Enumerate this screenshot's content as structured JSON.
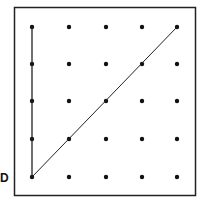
{
  "diagram": {
    "type": "dot-grid",
    "rows": 5,
    "cols": 5,
    "frame": {
      "x": 14,
      "y": 7,
      "width": 182,
      "height": 189
    },
    "grid_x": [
      32,
      69,
      106,
      142,
      177
    ],
    "grid_y": [
      27,
      64,
      101,
      139,
      177
    ],
    "point_label": "D",
    "segments": [
      {
        "name": "vertical-segment",
        "from": [
          0,
          0
        ],
        "to": [
          0,
          4
        ]
      },
      {
        "name": "diagonal-segment",
        "from": [
          0,
          0
        ],
        "to": [
          4,
          4
        ]
      }
    ],
    "colors": {
      "ink": "#111111",
      "background": "#ffffff"
    }
  }
}
